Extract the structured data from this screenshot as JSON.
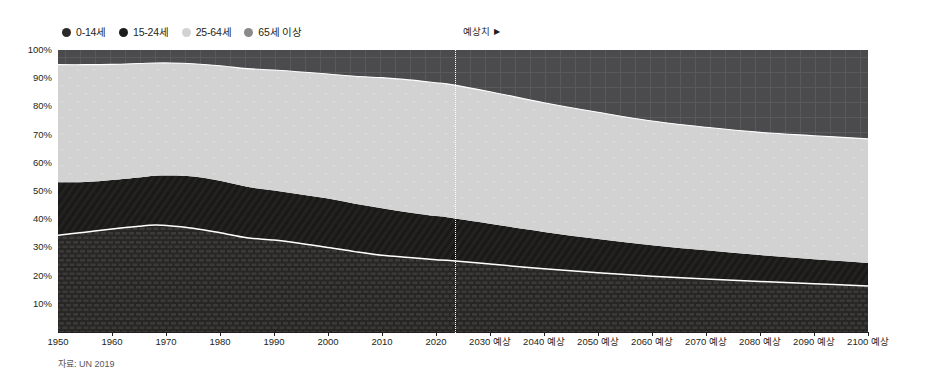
{
  "legend": {
    "items": [
      {
        "label": "0-14세",
        "color": "#2b2a29",
        "icon": "circle-icon"
      },
      {
        "label": "15-24세",
        "color": "#1d1d1b",
        "icon": "circle-icon"
      },
      {
        "label": "25-64세",
        "color": "#d2d2d2",
        "icon": "circle-icon"
      },
      {
        "label": "65세 이상",
        "color": "#8a8a8d",
        "icon": "circle-icon"
      }
    ]
  },
  "forecast": {
    "label": "예상치",
    "arrow": "▶",
    "start_year": 2022
  },
  "source": "자료: UN 2019",
  "axes": {
    "y_ticks": [
      "100%",
      "90%",
      "80%",
      "70%",
      "60%",
      "50%",
      "40%",
      "30%",
      "20%",
      "10%"
    ],
    "x_ticks": [
      "1950",
      "1960",
      "1970",
      "1980",
      "1990",
      "2000",
      "2010",
      "2020",
      "2030 예상",
      "2040 예상",
      "2050 예상",
      "2060 예상",
      "2070 예상",
      "2080 예상",
      "2090 예상",
      "2100 예상"
    ]
  },
  "chart_data": {
    "type": "area",
    "title": "",
    "subtitle": "",
    "xlabel": "",
    "ylabel": "",
    "stacked": true,
    "normalized": true,
    "grid": false,
    "legend_position": "top-left",
    "xlim": [
      1950,
      2100
    ],
    "ylim": [
      0,
      100
    ],
    "x": [
      1950,
      1955,
      1960,
      1965,
      1968,
      1971,
      1975,
      1980,
      1985,
      1990,
      1995,
      2000,
      2005,
      2010,
      2015,
      2020,
      2022,
      2030,
      2040,
      2050,
      2060,
      2070,
      2080,
      2090,
      2100
    ],
    "series": [
      {
        "name": "0-14세",
        "color": "#2b2a29",
        "pattern": "brick",
        "values": [
          34.3,
          35.4,
          36.5,
          37.5,
          37.9,
          37.6,
          36.8,
          35.2,
          33.4,
          32.6,
          31.4,
          30.0,
          28.5,
          27.2,
          26.4,
          25.6,
          25.4,
          24.1,
          22.4,
          21.0,
          19.8,
          18.8,
          17.9,
          17.1,
          16.3
        ]
      },
      {
        "name": "15-24세",
        "color": "#1d1d1b",
        "pattern": "diagonal",
        "values": [
          18.8,
          17.8,
          17.4,
          17.3,
          17.5,
          17.9,
          18.3,
          18.4,
          18.1,
          17.6,
          17.4,
          17.3,
          17.0,
          16.7,
          16.0,
          15.5,
          15.3,
          14.3,
          13.1,
          12.0,
          11.0,
          10.2,
          9.4,
          8.7,
          8.2
        ]
      },
      {
        "name": "25-64세",
        "color": "#d2d2d2",
        "pattern": "dots",
        "values": [
          41.7,
          41.6,
          41.0,
          40.4,
          40.0,
          39.9,
          40.0,
          40.8,
          41.9,
          42.7,
          43.4,
          44.2,
          45.2,
          46.3,
          47.0,
          47.3,
          47.3,
          46.8,
          45.8,
          44.9,
          44.0,
          43.6,
          43.5,
          43.8,
          44.0
        ]
      },
      {
        "name": "65세 이상",
        "color": "#4c4c4e",
        "pattern": "cross",
        "values": [
          5.2,
          5.2,
          5.1,
          4.8,
          4.6,
          4.6,
          4.9,
          5.6,
          6.6,
          7.1,
          7.8,
          8.5,
          9.3,
          9.8,
          10.6,
          11.6,
          12.0,
          14.8,
          18.7,
          22.1,
          25.2,
          27.4,
          29.2,
          30.4,
          31.5
        ]
      }
    ]
  }
}
